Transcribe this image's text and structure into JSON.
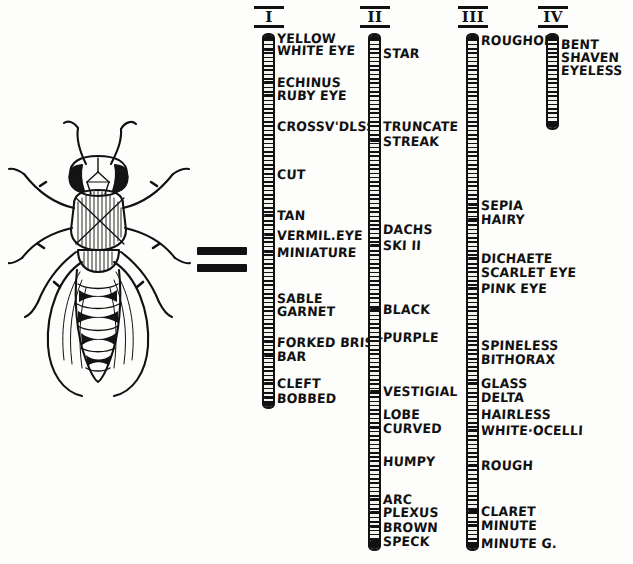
{
  "figure": {
    "type": "genetic-linkage-map",
    "subject_label": "drosophila-fly-drawing",
    "relation_symbol": "=",
    "relation_name": "equals-sign"
  },
  "chromosomes": [
    {
      "numeral": "I",
      "bar": {
        "x": 262,
        "top": 33,
        "bottom": 409
      },
      "label_x": 279,
      "loci": [
        {
          "label": "YELLOW",
          "y": 38
        },
        {
          "label": "WHITE EYE",
          "y": 50
        },
        {
          "label": "ECHINUS",
          "y": 82
        },
        {
          "label": "RUBY EYE",
          "y": 95
        },
        {
          "label": "CROSSV'DLSS",
          "y": 126
        },
        {
          "label": "CUT",
          "y": 174
        },
        {
          "label": "TAN",
          "y": 215
        },
        {
          "label": "VERMIL.EYE",
          "y": 235
        },
        {
          "label": "MINIATURE",
          "y": 252
        },
        {
          "label": "SABLE",
          "y": 298
        },
        {
          "label": "GARNET",
          "y": 311
        },
        {
          "label": "FORKED BRIST",
          "y": 342
        },
        {
          "label": "BAR",
          "y": 356
        },
        {
          "label": "CLEFT",
          "y": 383
        },
        {
          "label": "BOBBED",
          "y": 398
        }
      ]
    },
    {
      "numeral": "II",
      "bar": {
        "x": 368,
        "top": 33,
        "bottom": 551
      },
      "label_x": 385,
      "loci": [
        {
          "label": "STAR",
          "y": 53
        },
        {
          "label": "TRUNCATE",
          "y": 126
        },
        {
          "label": "STREAK",
          "y": 141
        },
        {
          "label": "DACHS",
          "y": 229
        },
        {
          "label": "SKI II",
          "y": 245
        },
        {
          "label": "BLACK",
          "y": 309
        },
        {
          "label": "PURPLE",
          "y": 337
        },
        {
          "label": "VESTIGIAL",
          "y": 391
        },
        {
          "label": "LOBE",
          "y": 414
        },
        {
          "label": "CURVED",
          "y": 428
        },
        {
          "label": "HUMPY",
          "y": 461
        },
        {
          "label": "ARC",
          "y": 499
        },
        {
          "label": "PLEXUS",
          "y": 512
        },
        {
          "label": "BROWN",
          "y": 527
        },
        {
          "label": "SPECK",
          "y": 541
        }
      ]
    },
    {
      "numeral": "III",
      "bar": {
        "x": 466,
        "top": 33,
        "bottom": 551
      },
      "label_x": 483,
      "loci": [
        {
          "label": "ROUGHOID",
          "y": 40
        },
        {
          "label": "SEPIA",
          "y": 205
        },
        {
          "label": "HAIRY",
          "y": 219
        },
        {
          "label": "DICHAETE",
          "y": 258
        },
        {
          "label": "SCARLET EYE",
          "y": 272
        },
        {
          "label": "PINK EYE",
          "y": 288
        },
        {
          "label": "SPINELESS",
          "y": 345
        },
        {
          "label": "BITHORAX",
          "y": 359
        },
        {
          "label": "GLASS",
          "y": 383
        },
        {
          "label": "DELTA",
          "y": 397
        },
        {
          "label": "HAIRLESS",
          "y": 414
        },
        {
          "label": "WHITE·OCELLI",
          "y": 430
        },
        {
          "label": "ROUGH",
          "y": 465
        },
        {
          "label": "CLARET",
          "y": 511
        },
        {
          "label": "MINUTE",
          "y": 525
        },
        {
          "label": "MINUTE G.",
          "y": 543
        }
      ]
    },
    {
      "numeral": "IV",
      "bar": {
        "x": 546,
        "top": 33,
        "bottom": 130
      },
      "label_x": 563,
      "loci": [
        {
          "label": "BENT",
          "y": 44
        },
        {
          "label": "SHAVEN",
          "y": 57
        },
        {
          "label": "EYELESS",
          "y": 70
        }
      ]
    }
  ]
}
